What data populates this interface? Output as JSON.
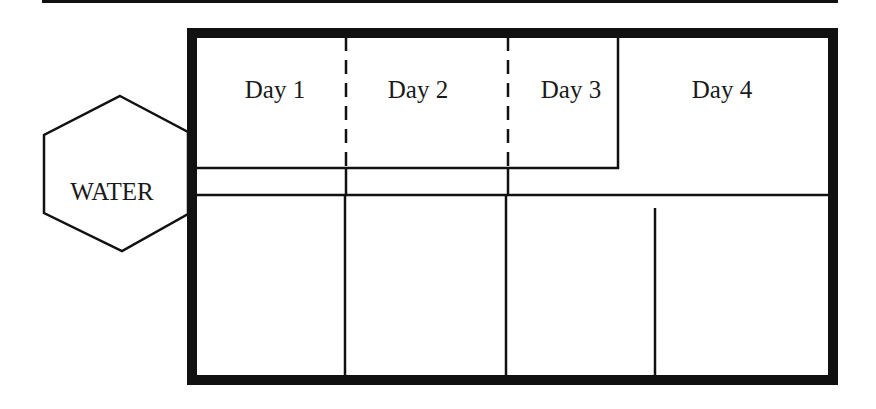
{
  "diagram": {
    "type": "floor-plan",
    "colors": {
      "stroke": "#111111",
      "background": "#ffffff",
      "text": "#1a1a1a"
    },
    "water": {
      "label": "WATER",
      "shape": "hexagon"
    },
    "days": [
      {
        "label": "Day 1"
      },
      {
        "label": "Day 2"
      },
      {
        "label": "Day 3"
      },
      {
        "label": "Day 4"
      }
    ],
    "lower_compartments": 5
  }
}
